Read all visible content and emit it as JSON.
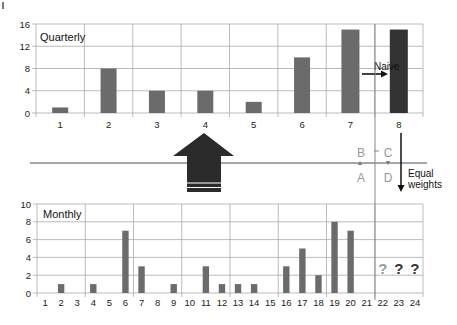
{
  "chart_data": [
    {
      "type": "bar",
      "title": "Quarterly",
      "categories": [
        "1",
        "2",
        "3",
        "4",
        "5",
        "6",
        "7",
        "8"
      ],
      "values": [
        1,
        8,
        4,
        4,
        2,
        10,
        15,
        15
      ],
      "highlight_index": 7,
      "ylim": [
        0,
        16
      ],
      "yticks": [
        0,
        4,
        8,
        12,
        16
      ],
      "grid": true,
      "annotation": "Naive"
    },
    {
      "type": "bar",
      "title": "Monthly",
      "categories": [
        "1",
        "2",
        "3",
        "4",
        "5",
        "6",
        "7",
        "8",
        "9",
        "10",
        "11",
        "12",
        "13",
        "14",
        "15",
        "16",
        "17",
        "18",
        "19",
        "20",
        "21",
        "22",
        "23",
        "24"
      ],
      "values": [
        0,
        1,
        0,
        1,
        0,
        7,
        3,
        0,
        1,
        0,
        3,
        1,
        1,
        1,
        0,
        3,
        5,
        2,
        8,
        7,
        0,
        null,
        null,
        null
      ],
      "unknown_labels": [
        "?",
        "?",
        "?"
      ],
      "ylim": [
        0,
        10
      ],
      "yticks": [
        0,
        2,
        4,
        6,
        8,
        10
      ],
      "grid": true
    }
  ],
  "annotations": {
    "naive": "Naive",
    "equal_weights_line1": "Equal",
    "equal_weights_line2": "weights",
    "points": [
      "A",
      "B",
      "C",
      "D"
    ],
    "unknowns": [
      "?",
      "?",
      "?"
    ]
  },
  "colors": {
    "bar": "#6b6b6b",
    "bar_highlight": "#333333",
    "grid": "#aaaaaa",
    "arrow": "#2b2b2b",
    "point_label": "#999999"
  }
}
